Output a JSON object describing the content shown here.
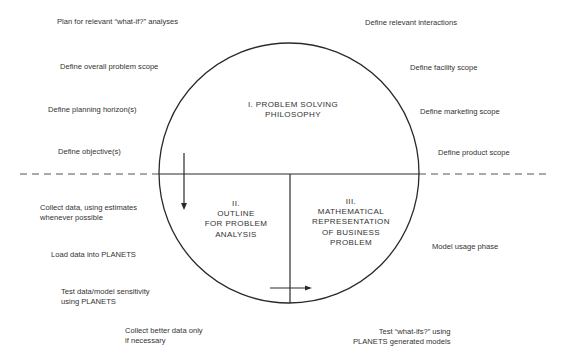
{
  "diagram": {
    "sections": [
      {
        "id": "I",
        "label": "I.  PROBLEM SOLVING\nPHILOSOPHY"
      },
      {
        "id": "II",
        "label": "II.\nOUTLINE\nFOR PROBLEM\nANALYSIS"
      },
      {
        "id": "III",
        "label": "III.\nMATHEMATICAL\nREPRESENTATION\nOF BUSINESS\nPROBLEM"
      }
    ],
    "left_top_labels": [
      "Plan for relevant “what-if?” analyses",
      "Define overall problem scope",
      "Define planning horizon(s)",
      "Define objective(s)"
    ],
    "right_top_labels": [
      "Define relevant interactions",
      "Define facility scope",
      "Define marketing scope",
      "Define product scope"
    ],
    "left_bottom_labels": [
      "Collect data, using estimates\nwhenever possible",
      "Load data into PLANETS",
      "Test data/model sensitivity\nusing PLANETS",
      "Collect better data only\nif necessary"
    ],
    "right_bottom_labels": [
      "Model usage phase",
      "Test “what-ifs?” using\nPLANETS generated models"
    ],
    "colors": {
      "line": "#2a2a2a",
      "dash": "#555555",
      "text": "#333333"
    }
  }
}
